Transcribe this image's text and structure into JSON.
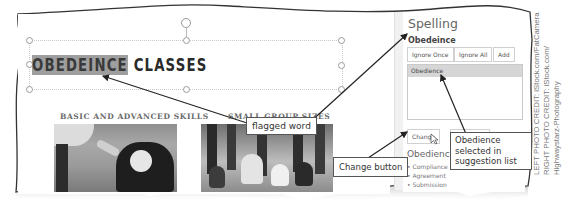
{
  "slide": {
    "title_flagged": "OBEDEINCE",
    "title_rest": " CLASSES",
    "left_heading": "BASIC AND ADVANCED SKILLS",
    "right_heading": "SMALL GROUP SIZES",
    "left_photo_alt": "person shaking paw with Bernese mountain dog",
    "right_photo_alt": "group of dogs sitting with owners"
  },
  "spelling_pane": {
    "title": "Spelling",
    "flagged_word": "Obedeince",
    "buttons": {
      "ignore_once": "Ignore Once",
      "ignore_all": "Ignore All",
      "add": "Add"
    },
    "suggestions": [
      "Obedience"
    ],
    "change_button": "Change",
    "change_all_button": "Ch",
    "definition": {
      "word": "Obedience",
      "synonyms": [
        "• Compliance",
        "• Agreement",
        "• Submission"
      ]
    }
  },
  "callouts": {
    "flagged_word": "flagged word",
    "change_button": "Change button",
    "suggestion": "Obedience selected in suggestion list"
  },
  "credits": {
    "line1": "LEFT PHOTO CREDIT: iStock.com/FatCamera",
    "line2": "RIGHT PHOTO CREDIT: iStock.com/",
    "line3": "Highwaystarz-Photography"
  }
}
